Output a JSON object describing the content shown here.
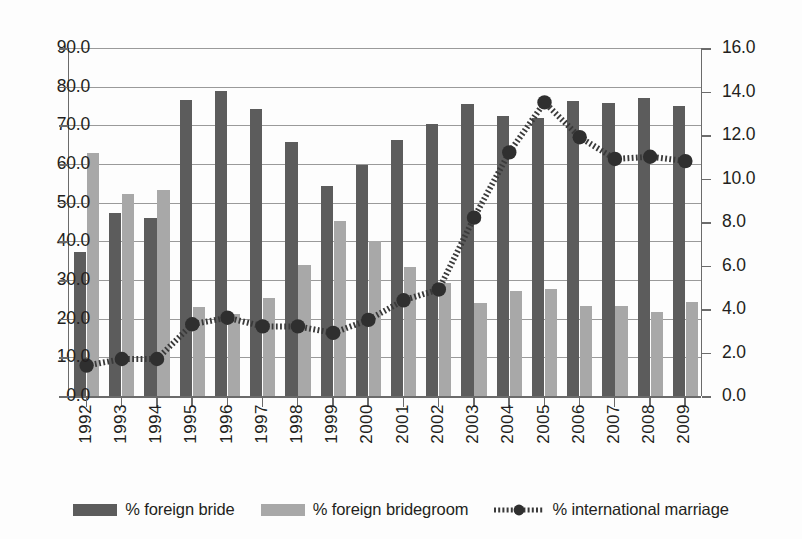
{
  "chart_data": {
    "type": "bar",
    "title": "",
    "xlabel": "",
    "ylabel": "",
    "categories": [
      "1992",
      "1993",
      "1994",
      "1995",
      "1996",
      "1997",
      "1998",
      "1999",
      "2000",
      "2001",
      "2002",
      "2003",
      "2004",
      "2005",
      "2006",
      "2007",
      "2008",
      "2009"
    ],
    "grid": true,
    "legend_position": "bottom",
    "axes": {
      "left": {
        "label": "",
        "ylim": [
          0.0,
          90.0
        ],
        "tick_step": 10.0,
        "ticks": [
          "0.0",
          "10.0",
          "20.0",
          "30.0",
          "40.0",
          "50.0",
          "60.0",
          "70.0",
          "80.0",
          "90.0"
        ]
      },
      "right": {
        "label": "",
        "ylim": [
          0.0,
          16.0
        ],
        "tick_step": 2.0,
        "ticks": [
          "0.0",
          "2.0",
          "4.0",
          "6.0",
          "8.0",
          "10.0",
          "12.0",
          "14.0",
          "16.0"
        ]
      }
    },
    "series": [
      {
        "name": "% foreign bride",
        "type": "bar",
        "axis": "left",
        "color": "#5c5c5c",
        "values": [
          37.3,
          47.3,
          46.1,
          76.5,
          78.8,
          74.2,
          65.7,
          54.4,
          59.8,
          66.3,
          70.4,
          75.6,
          72.4,
          71.9,
          76.4,
          75.8,
          77.2,
          75.0
        ]
      },
      {
        "name": "% foreign bridegroom",
        "type": "bar",
        "axis": "left",
        "color": "#a8a8a8",
        "values": [
          62.8,
          52.3,
          53.4,
          23.1,
          21.2,
          25.3,
          33.9,
          45.3,
          40.2,
          33.3,
          29.2,
          24.0,
          27.2,
          27.6,
          23.2,
          23.3,
          21.8,
          24.4
        ]
      },
      {
        "name": "% international marriage",
        "type": "line",
        "axis": "right",
        "color": "#3a3a3a",
        "marker": "circle",
        "linestyle": "dashed",
        "values": [
          1.4,
          1.7,
          1.7,
          3.3,
          3.6,
          3.2,
          3.2,
          2.9,
          3.5,
          4.4,
          4.9,
          8.2,
          11.2,
          13.5,
          11.9,
          10.9,
          11.0,
          10.8
        ]
      }
    ]
  },
  "legend": {
    "items": [
      {
        "label": "% foreign bride",
        "swatch": "dark-bar-swatch"
      },
      {
        "label": "% foreign bridegroom",
        "swatch": "light-bar-swatch"
      },
      {
        "label": "% international marriage",
        "swatch": "dashed-line-marker-swatch"
      }
    ]
  }
}
